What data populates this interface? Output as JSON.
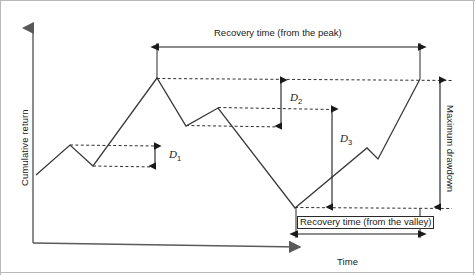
{
  "figure": {
    "title_semantic": "cumulative-return-drawdown-diagram",
    "background_color": "#ffffff",
    "line_color": "#3a3a3a",
    "axis_color": "#5a5a5a",
    "annotation_color": "#1a1a1a"
  },
  "axes": {
    "y_label": "Cumulative return",
    "x_label": "Time"
  },
  "annotations": {
    "recovery_peak": "Recovery time (from the peak)",
    "recovery_valley": "Recovery time (from the valley)",
    "maximum_drawdown": "Maximum drawdown",
    "d1": "D",
    "d1_sub": "1",
    "d2": "D",
    "d2_sub": "2",
    "d3": "D",
    "d3_sub": "3"
  },
  "chart_data": {
    "type": "line",
    "title": "",
    "xlabel": "Time",
    "ylabel": "Cumulative return",
    "grid": false,
    "legend": "none",
    "axis_ticks": "none",
    "series": [
      {
        "name": "Cumulative return",
        "points": [
          {
            "x": 36,
            "y": 175,
            "role": "start"
          },
          {
            "x": 70,
            "y": 145,
            "role": "peak-1"
          },
          {
            "x": 93,
            "y": 166,
            "role": "trough-1"
          },
          {
            "x": 157,
            "y": 78,
            "role": "peak-max"
          },
          {
            "x": 186,
            "y": 126,
            "role": "trough-2"
          },
          {
            "x": 218,
            "y": 108,
            "role": "peak-2"
          },
          {
            "x": 295,
            "y": 208,
            "role": "valley-min"
          },
          {
            "x": 367,
            "y": 148,
            "role": "peak-3"
          },
          {
            "x": 378,
            "y": 159,
            "role": "trough-3"
          },
          {
            "x": 420,
            "y": 79,
            "role": "recovery-end"
          }
        ]
      }
    ],
    "reference_levels": [
      {
        "name": "peak-1-level",
        "y": 145,
        "x_from": 70,
        "x_to": 155,
        "style": "dashed"
      },
      {
        "name": "trough-1-level",
        "y": 166,
        "x_from": 93,
        "x_to": 155,
        "style": "dashed"
      },
      {
        "name": "peak-max-level",
        "y": 79,
        "x_from": 157,
        "x_to": 452,
        "style": "dashed"
      },
      {
        "name": "trough-2-level",
        "y": 126,
        "x_from": 186,
        "x_to": 281,
        "style": "dashed"
      },
      {
        "name": "peak-2-level",
        "y": 108,
        "x_from": 218,
        "x_to": 332,
        "style": "dashed"
      },
      {
        "name": "valley-min-level",
        "y": 208,
        "x_from": 295,
        "x_to": 452,
        "style": "dashed"
      }
    ],
    "measures": [
      {
        "name": "D1",
        "type": "vertical-double-arrow",
        "x": 155,
        "y_top": 145,
        "y_bottom": 166
      },
      {
        "name": "D2",
        "type": "vertical-double-arrow",
        "x": 281,
        "y_top": 80,
        "y_bottom": 126
      },
      {
        "name": "D3",
        "type": "vertical-double-arrow",
        "x": 332,
        "y_top": 109,
        "y_bottom": 207
      },
      {
        "name": "Maximum drawdown",
        "type": "vertical-double-arrow",
        "x": 440,
        "y_top": 80,
        "y_bottom": 207
      },
      {
        "name": "Recovery time (from the peak)",
        "type": "horizontal-double-arrow",
        "y": 47,
        "x_left": 157,
        "x_right": 420
      },
      {
        "name": "Recovery time (from the valley)",
        "type": "horizontal-double-arrow",
        "y": 234,
        "x_left": 296,
        "x_right": 420
      }
    ]
  }
}
